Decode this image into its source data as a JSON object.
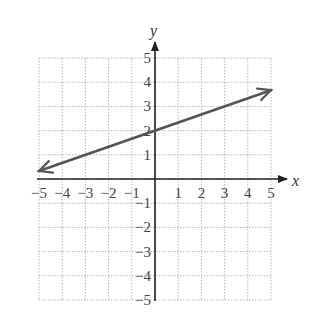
{
  "chart_data": {
    "type": "line",
    "title": "",
    "xlabel": "x",
    "ylabel": "y",
    "xlim": [
      -5,
      5
    ],
    "ylim": [
      -5,
      5
    ],
    "grid": true,
    "grid_style": "dotted",
    "x_ticks": [
      "-5",
      "-4",
      "-3",
      "-2",
      "-1",
      "1",
      "2",
      "3",
      "4",
      "5"
    ],
    "y_ticks": [
      "5",
      "4",
      "3",
      "2",
      "1",
      "-1",
      "-2",
      "-3",
      "-4",
      "-5"
    ],
    "series": [
      {
        "name": "line",
        "equation": "y = (1/3)x + 2",
        "slope": 0.333,
        "y_intercept": 2,
        "x": [
          -5,
          0,
          5
        ],
        "y": [
          0.33,
          2,
          3.67
        ],
        "arrows": "both ends",
        "color": "#555555"
      }
    ],
    "legend": null
  },
  "colors": {
    "axis": "#222222",
    "grid": "#b8b8b8",
    "line": "#555555"
  }
}
